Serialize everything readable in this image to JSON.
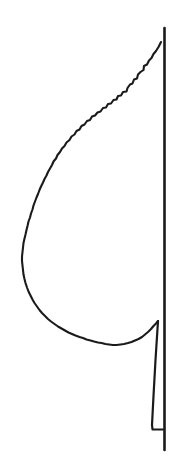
{
  "figure": {
    "domain": "Natural-Image",
    "kind": "botanical-line-drawing",
    "canvas": {
      "width": 185,
      "height": 474
    },
    "background_color": "#ffffff",
    "ink_color": "#1a1a1a"
  },
  "parts": {
    "midrib": {
      "name": "midrib",
      "description": "Straight vertical central vein line on the right side",
      "x": 164.5,
      "y_top": 28,
      "y_bottom": 450,
      "stroke_width": 2.6,
      "color": "#1a1a1a"
    },
    "blade": {
      "name": "leaf-blade-margin",
      "description": "Serrated (dentate) leaf margin sweeping from apex at top right, bulging left, down to the base",
      "stroke_width": 2.1,
      "color": "#1a1a1a",
      "apex": {
        "x": 161,
        "y": 42
      },
      "widest_left": {
        "x": 21,
        "y": 246
      },
      "lowest_point": {
        "x": 112,
        "y": 351
      },
      "base": {
        "x": 158,
        "y": 321
      },
      "margin_type": "serrate",
      "tooth_count": 42,
      "path": "M161,42 L158.5,47 L156,51 L153.5,54 L151.5,58 L149,60.5 L147,64.5 L144,66 L143.5,70 L140.5,72 L138,74.5 L137,78.5 L134,79.5 L132.5,83.5 L130,84.5 L127.5,88 L126.5,91.5 L123,92 L121,95.5 L118,96 L116.5,99.5 L113.5,100 L111,103.5 L108,104 L106,107.5 L103,108 L100.5,111.5 L97.5,112.5 L95,115.5 L92,116.5 L90,120 L87,121 L84.5,124.5 L81.5,126 L79.5,129.5 L76.5,131 L74.5,134.5 L71.5,136.5 L69.5,140 L66.5,142.5 L64.5,146 L62,148.5 L60,152 L57.5,155 L56,158.5 L53.5,161.5 L52,165 L50,168.5 L48,172 L46.5,175.5 L44.5,179 L43,182.5 L41,186.5 L39.5,190 L38,194 L36.5,197.5 L35,201.5 L33.5,205.5 L32.5,209.5 L31,213.5 L30,217.5 L28.5,221.5 L27.5,226 L26.5,230 L25.5,234.5 L24.5,238.5 L23.5,243 L23,247.5 L22.5,252 L22,256.5 L22,261 L22.5,265.5 L23,270 L23.5,274.5 L24.5,279 L25.5,283 L27,287.5 L28.5,291.5 L30.5,295.5 L32.5,299.5 L34.5,303 L37,306.5 L39.5,310 L42,313 L45,316 L48,319 L51,321.5 L54.5,324 L58,326.5 L61.5,328.5 L65,330.5 L68.5,332.5 L72,334 L75.5,335.5 L79.5,337 L83,338 L86.5,339.5 L90.5,340.5 L94,341.5 L98,342.5 L101.5,343 L105.5,344 L109,344.5 L113,345 L116.5,345 L120.5,344.5 L124,344 L128,343 L131.5,342 L135,340.5 L138.5,339 L142,337 L145,334.5 L148,332 L151,329 L153.5,326 L156,323.5 L158,321"
    },
    "petiole": {
      "name": "petiole",
      "description": "Narrow leaf stalk wing descending from the blade base alongside the midrib",
      "stroke_width": 2.2,
      "color": "#1a1a1a",
      "top": {
        "x": 158,
        "y": 321
      },
      "bottom_left": {
        "x": 152,
        "y": 429
      },
      "bottom_right": {
        "x": 163,
        "y": 429
      },
      "path": "M158,321 L155.5,360 L153.5,396 L152,425 L152.5,429.5 L163,429.5"
    }
  },
  "labels": {
    "figure_caption": "",
    "alt_text": "Black ink line drawing of one half of a serrate-margined leaf joined to a straight vertical midrib, with a narrow petiole at the base."
  }
}
